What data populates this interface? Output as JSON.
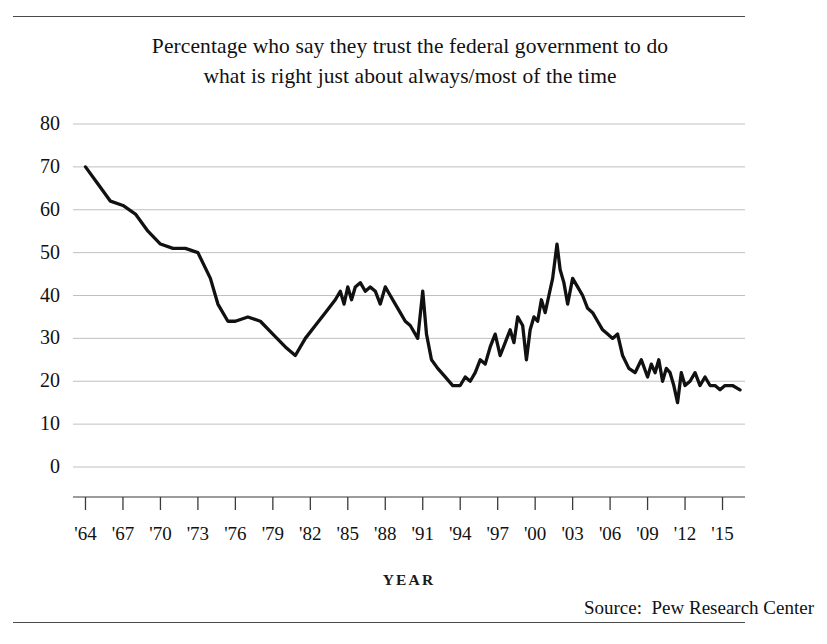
{
  "figure": {
    "title_line_1": "Percentage who say they trust the federal government to do",
    "title_line_2": "what is right just about always/most of the time",
    "axis_title": "YEAR",
    "source": "Source:  Pew Research Center"
  },
  "chart_data": {
    "type": "line",
    "title": "Percentage who say they trust the federal government to do what is right just about always/most of the time",
    "xlabel": "YEAR",
    "ylabel": "",
    "xlim": [
      1963.0,
      2016.8
    ],
    "ylim": [
      0,
      80
    ],
    "grid": true,
    "legend": false,
    "line_color": "#111111",
    "grid_color": "#b9b9b9",
    "ytick_labels": [
      "80",
      "70",
      "60",
      "50",
      "40",
      "30",
      "20",
      "10",
      "0"
    ],
    "yticks": [
      80,
      70,
      60,
      50,
      40,
      30,
      20,
      10,
      0
    ],
    "xtick_labels": [
      "'64",
      "'67",
      "'70",
      "'73",
      "'76",
      "'79",
      "'82",
      "'85",
      "'88",
      "'91",
      "'94",
      "'97",
      "'00",
      "'03",
      "'06",
      "'09",
      "'12",
      "'15"
    ],
    "xticks": [
      1964,
      1967,
      1970,
      1973,
      1976,
      1979,
      1982,
      1985,
      1988,
      1991,
      1994,
      1997,
      2000,
      2003,
      2006,
      2009,
      2012,
      2015
    ],
    "series": [
      {
        "name": "Trust in federal government",
        "x": [
          1964.0,
          1965.0,
          1966.0,
          1967.0,
          1968.0,
          1969.0,
          1970.0,
          1971.0,
          1972.0,
          1973.0,
          1974.0,
          1974.6,
          1975.4,
          1976.0,
          1977.0,
          1978.0,
          1979.0,
          1980.0,
          1980.8,
          1981.6,
          1982.4,
          1983.2,
          1984.0,
          1984.4,
          1984.7,
          1985.0,
          1985.3,
          1985.6,
          1986.0,
          1986.4,
          1986.8,
          1987.2,
          1987.6,
          1988.0,
          1988.4,
          1988.8,
          1989.2,
          1989.6,
          1990.0,
          1990.6,
          1991.0,
          1991.3,
          1991.7,
          1992.2,
          1992.8,
          1993.4,
          1994.0,
          1994.4,
          1994.8,
          1995.2,
          1995.6,
          1996.0,
          1996.4,
          1996.8,
          1997.2,
          1997.6,
          1998.0,
          1998.3,
          1998.6,
          1999.0,
          1999.3,
          1999.6,
          1999.9,
          2000.2,
          2000.5,
          2000.8,
          2001.1,
          2001.4,
          2001.75,
          2002.0,
          2002.3,
          2002.6,
          2003.0,
          2003.4,
          2003.8,
          2004.2,
          2004.6,
          2005.0,
          2005.4,
          2005.8,
          2006.2,
          2006.6,
          2007.0,
          2007.5,
          2008.0,
          2008.5,
          2009.0,
          2009.3,
          2009.6,
          2009.9,
          2010.2,
          2010.5,
          2010.8,
          2011.1,
          2011.4,
          2011.7,
          2012.0,
          2012.4,
          2012.8,
          2013.2,
          2013.6,
          2014.0,
          2014.4,
          2014.8,
          2015.2,
          2015.8,
          2016.4
        ],
        "y": [
          70,
          66,
          62,
          61,
          59,
          55,
          52,
          51,
          51,
          50,
          44,
          38,
          34,
          34,
          35,
          34,
          31,
          28,
          26,
          30,
          33,
          36,
          39,
          41,
          38,
          42,
          39,
          42,
          43,
          41,
          42,
          41,
          38,
          42,
          40,
          38,
          36,
          34,
          33,
          30,
          41,
          31,
          25,
          23,
          21,
          19,
          19,
          21,
          20,
          22,
          25,
          24,
          28,
          31,
          26,
          29,
          32,
          29,
          35,
          33,
          25,
          32,
          35,
          34,
          39,
          36,
          40,
          44,
          52,
          46,
          43,
          38,
          44,
          42,
          40,
          37,
          36,
          34,
          32,
          31,
          30,
          31,
          26,
          23,
          22,
          25,
          21,
          24,
          22,
          25,
          20,
          23,
          22,
          19,
          15,
          22,
          19,
          20,
          22,
          19,
          21,
          19,
          19,
          18,
          19,
          19,
          18
        ]
      }
    ],
    "annotations": [
      {
        "text": "peak",
        "x": 1964,
        "y": 70
      },
      {
        "text": "trough",
        "x": 1980.8,
        "y": 26
      },
      {
        "text": "post-9/11 peak",
        "x": 2001.75,
        "y": 52
      },
      {
        "text": "end",
        "x": 2016.4,
        "y": 18
      }
    ]
  }
}
